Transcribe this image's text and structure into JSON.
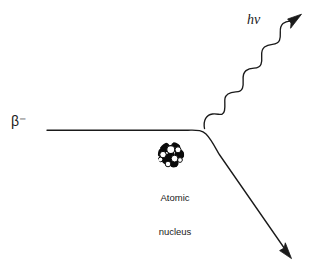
{
  "figure": {
    "background_color": "#ffffff",
    "stroke_color": "#1a1a1a"
  },
  "labels": {
    "beta_particle": "β⁻",
    "photon": "hν",
    "nucleus_line1": "Atomic",
    "nucleus_line2": "nucleus"
  },
  "elements": {
    "incoming_path": {
      "name": "incoming beta trajectory",
      "description": "horizontal straight line entering from the left",
      "start": [
        47,
        130
      ],
      "end": [
        186,
        130
      ]
    },
    "deflection_curve": {
      "name": "deflection bend",
      "description": "smooth curve bending downward past the nucleus",
      "apex": [
        205,
        128
      ]
    },
    "outgoing_path": {
      "name": "outgoing beta trajectory",
      "description": "straight diagonal line descending to lower right, ending in a solid arrowhead",
      "end": [
        291,
        257
      ],
      "arrowhead": "solid-triangle"
    },
    "photon_wave": {
      "name": "emitted photon",
      "description": "sinusoidal wave ascending to the upper right with a solid arrowhead",
      "start": [
        204,
        128
      ],
      "end": [
        300,
        17
      ],
      "oscillations": 3,
      "arrowhead": "solid-triangle"
    },
    "nucleus": {
      "name": "atomic nucleus",
      "description": "cluster of filled and outlined circular nucleons",
      "center": [
        171,
        155
      ],
      "radius": 13,
      "nucleon_fill_dark": "#000000",
      "nucleon_fill_light": "#ffffff"
    }
  }
}
